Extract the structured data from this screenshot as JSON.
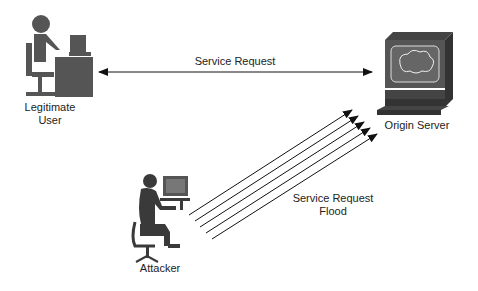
{
  "nodes": {
    "legit_user": {
      "label_line1": "Legitimate",
      "label_line2": "User"
    },
    "origin_server": {
      "label": "Origin Server"
    },
    "attacker": {
      "label": "Attacker"
    }
  },
  "edges": {
    "service_request": {
      "label": "Service Request"
    },
    "flood": {
      "label_line1": "Service Request",
      "label_line2": "Flood",
      "count": 5
    }
  }
}
